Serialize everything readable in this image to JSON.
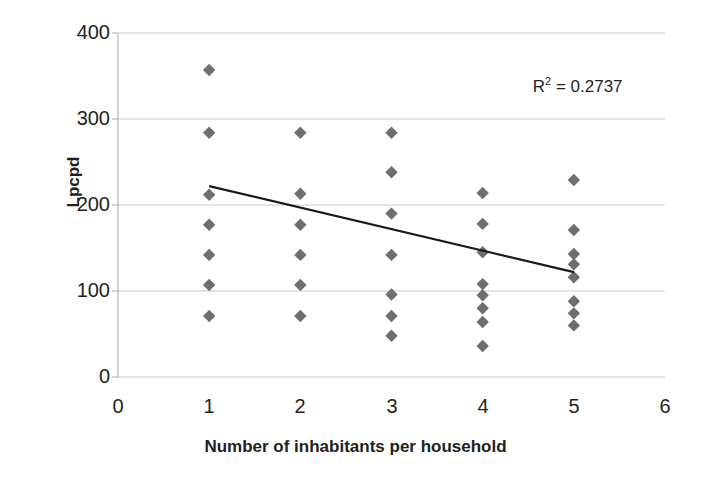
{
  "chart_data": {
    "type": "scatter",
    "title": "",
    "xlabel": "Number of inhabitants per household",
    "ylabel": "Lpcpd",
    "xlim": [
      0,
      6
    ],
    "ylim": [
      0,
      400
    ],
    "xticks": [
      0,
      1,
      2,
      3,
      4,
      5,
      6
    ],
    "yticks": [
      0,
      100,
      200,
      300,
      400
    ],
    "grid": "horizontal",
    "legend": "none",
    "marker": "diamond",
    "marker_color": "#6e6e6e",
    "trendline_color": "#1a1a1a",
    "annotations": [
      {
        "text": "R2 = 0.2737",
        "x": 4.55,
        "y": 340
      }
    ],
    "points": [
      {
        "x": 1,
        "y": 357
      },
      {
        "x": 1,
        "y": 284
      },
      {
        "x": 1,
        "y": 212
      },
      {
        "x": 1,
        "y": 177
      },
      {
        "x": 1,
        "y": 142
      },
      {
        "x": 1,
        "y": 107
      },
      {
        "x": 1,
        "y": 71
      },
      {
        "x": 2,
        "y": 284
      },
      {
        "x": 2,
        "y": 213
      },
      {
        "x": 2,
        "y": 177
      },
      {
        "x": 2,
        "y": 142
      },
      {
        "x": 2,
        "y": 107
      },
      {
        "x": 2,
        "y": 71
      },
      {
        "x": 3,
        "y": 284
      },
      {
        "x": 3,
        "y": 238
      },
      {
        "x": 3,
        "y": 190
      },
      {
        "x": 3,
        "y": 142
      },
      {
        "x": 3,
        "y": 96
      },
      {
        "x": 3,
        "y": 71
      },
      {
        "x": 3,
        "y": 48
      },
      {
        "x": 4,
        "y": 214
      },
      {
        "x": 4,
        "y": 178
      },
      {
        "x": 4,
        "y": 145
      },
      {
        "x": 4,
        "y": 108
      },
      {
        "x": 4,
        "y": 95
      },
      {
        "x": 4,
        "y": 80
      },
      {
        "x": 4,
        "y": 64
      },
      {
        "x": 4,
        "y": 36
      },
      {
        "x": 5,
        "y": 229
      },
      {
        "x": 5,
        "y": 171
      },
      {
        "x": 5,
        "y": 143
      },
      {
        "x": 5,
        "y": 131
      },
      {
        "x": 5,
        "y": 116
      },
      {
        "x": 5,
        "y": 88
      },
      {
        "x": 5,
        "y": 74
      },
      {
        "x": 5,
        "y": 60
      }
    ],
    "trendline": {
      "x_start": 1,
      "y_start": 222,
      "x_end": 5,
      "y_end": 122
    }
  },
  "labels": {
    "y_axis_title": "Lpcpd",
    "x_axis_title": "Number of inhabitants per household",
    "r2_prefix": "R",
    "r2_sup": "2",
    "r2_value": " = 0.2737",
    "ytick_400": "400",
    "ytick_300": "300",
    "ytick_200": "200",
    "ytick_100": "100",
    "ytick_0": "0",
    "xtick_0": "0",
    "xtick_1": "1",
    "xtick_2": "2",
    "xtick_3": "3",
    "xtick_4": "4",
    "xtick_5": "5",
    "xtick_6": "6"
  },
  "colors": {
    "marker": "#6e6e6e",
    "trendline": "#1a1a1a",
    "gridline": "#c9c9c9",
    "axis": "#b5b5b5",
    "text": "#231f20"
  }
}
